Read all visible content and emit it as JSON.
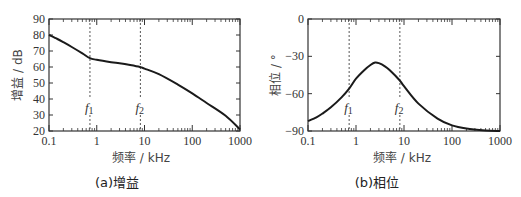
{
  "chart_data": [
    {
      "id": "a",
      "type": "line",
      "caption": "(a)增益",
      "xlabel": "频率 / kHz",
      "ylabel": "增益 / dB",
      "xscale": "log",
      "xlim": [
        0.1,
        1000
      ],
      "ylim": [
        20,
        90
      ],
      "xticks": [
        0.1,
        1,
        10,
        100,
        1000
      ],
      "xtick_labels": [
        "0.1",
        "1",
        "10",
        "100",
        "1000"
      ],
      "yticks": [
        20,
        30,
        40,
        50,
        60,
        70,
        80,
        90
      ],
      "ytick_labels": [
        "20",
        "30",
        "40",
        "50",
        "60",
        "70",
        "80",
        "90"
      ],
      "grid": false,
      "markers": [
        {
          "name": "f1",
          "label": "f",
          "sub": "1",
          "x": 0.72
        },
        {
          "name": "f2",
          "label": "f",
          "sub": "2",
          "x": 8.2
        }
      ],
      "series": [
        {
          "name": "gain",
          "x": [
            0.1,
            0.15,
            0.2,
            0.3,
            0.5,
            0.72,
            1,
            2,
            3,
            5,
            8,
            10,
            20,
            50,
            100,
            200,
            500,
            1000
          ],
          "y": [
            80,
            77.5,
            75.5,
            72.5,
            68.5,
            65.5,
            64.5,
            63,
            62.3,
            61.2,
            60,
            59,
            55.5,
            49,
            43.5,
            37.5,
            29.5,
            21
          ]
        }
      ]
    },
    {
      "id": "b",
      "type": "line",
      "caption": "(b)相位",
      "xlabel": "频率 / kHz",
      "ylabel": "相位 / °",
      "xscale": "log",
      "xlim": [
        0.1,
        1000
      ],
      "ylim": [
        -90,
        0
      ],
      "xticks": [
        0.1,
        1,
        10,
        100,
        1000
      ],
      "xtick_labels": [
        "0.1",
        "1",
        "10",
        "100",
        "1000"
      ],
      "yticks": [
        -90,
        -60,
        -30,
        0
      ],
      "ytick_labels": [
        "−90",
        "−60",
        "−30",
        "0"
      ],
      "grid": false,
      "markers": [
        {
          "name": "f1",
          "label": "f",
          "sub": "1",
          "x": 0.72
        },
        {
          "name": "f2",
          "label": "f",
          "sub": "2",
          "x": 8.2
        }
      ],
      "series": [
        {
          "name": "phase",
          "x": [
            0.1,
            0.15,
            0.2,
            0.3,
            0.5,
            0.72,
            1,
            1.5,
            2,
            2.5,
            3,
            4,
            5,
            8,
            10,
            20,
            50,
            100,
            200,
            500,
            1000
          ],
          "y": [
            -82,
            -79,
            -76,
            -71,
            -63,
            -56,
            -48,
            -41,
            -37,
            -35,
            -35.5,
            -38,
            -41,
            -49,
            -54,
            -68,
            -80,
            -85.5,
            -88,
            -89.5,
            -90
          ]
        }
      ]
    }
  ]
}
